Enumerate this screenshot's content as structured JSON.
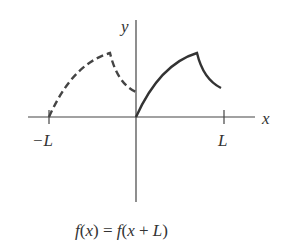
{
  "diagram": {
    "axes": {
      "x_label": "x",
      "y_label": "y",
      "tick_left": "−L",
      "tick_right": "L"
    },
    "caption": {
      "f1": "f",
      "x1": "x",
      "eq": " = ",
      "f2": "f",
      "x2": "x",
      "plus": " + ",
      "L": "L"
    },
    "curves": [
      {
        "name": "periodic-copy",
        "style": "dashed",
        "interval": "[-L, 0]"
      },
      {
        "name": "function",
        "style": "solid",
        "interval": "[0, L]"
      }
    ],
    "colors": {
      "stroke": "#333333"
    }
  }
}
